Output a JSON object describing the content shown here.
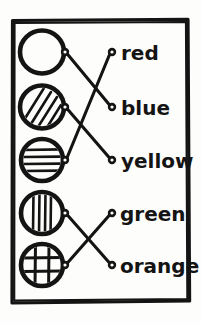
{
  "worksheet": {
    "style": "hand-drawn",
    "ink_color": "#141414",
    "paper_color": "#fdfdfb",
    "frame": {
      "x": 11,
      "y": 19,
      "width": 179,
      "height": 285
    }
  },
  "left_column": {
    "label": "patterned-circles",
    "items": [
      {
        "id": "circle-empty",
        "pattern": "empty",
        "pattern_label": "blank circle",
        "cx": 42,
        "cy": 52,
        "r": 22,
        "dot_x": 65,
        "dot_y": 52
      },
      {
        "id": "circle-diagonal",
        "pattern": "diagonal-stripes",
        "pattern_label": "diagonal stripes circle",
        "cx": 42,
        "cy": 107,
        "r": 22,
        "dot_x": 65,
        "dot_y": 107
      },
      {
        "id": "circle-horizontal",
        "pattern": "horizontal-stripes",
        "pattern_label": "horizontal stripes circle",
        "cx": 42,
        "cy": 160,
        "r": 21,
        "dot_x": 65,
        "dot_y": 160
      },
      {
        "id": "circle-vertical",
        "pattern": "vertical-stripes",
        "pattern_label": "vertical stripes circle",
        "cx": 42,
        "cy": 213,
        "r": 21,
        "dot_x": 65,
        "dot_y": 213
      },
      {
        "id": "circle-grid",
        "pattern": "grid-crosshatch",
        "pattern_label": "crosshatch grid circle",
        "cx": 42,
        "cy": 265,
        "r": 21,
        "dot_x": 65,
        "dot_y": 265
      }
    ]
  },
  "right_column": {
    "label": "color-words",
    "items": [
      {
        "id": "word-red",
        "text": "red",
        "dot_x": 112,
        "dot_y": 52,
        "text_x": 121,
        "text_y": 60
      },
      {
        "id": "word-blue",
        "text": "blue",
        "dot_x": 112,
        "dot_y": 107,
        "text_x": 121,
        "text_y": 115
      },
      {
        "id": "word-yellow",
        "text": "yellow",
        "dot_x": 112,
        "dot_y": 160,
        "text_x": 121,
        "text_y": 168
      },
      {
        "id": "word-green",
        "text": "green",
        "dot_x": 112,
        "dot_y": 213,
        "text_x": 120,
        "text_y": 221
      },
      {
        "id": "word-orange",
        "text": "orange",
        "dot_x": 112,
        "dot_y": 265,
        "text_x": 120,
        "text_y": 273
      }
    ]
  },
  "connections": [
    {
      "id": "link-empty-to-blue",
      "from": "circle-empty",
      "to": "word-blue",
      "x1": 65,
      "y1": 52,
      "x2": 112,
      "y2": 107
    },
    {
      "id": "link-diagonal-to-yellow",
      "from": "circle-diagonal",
      "to": "word-yellow",
      "x1": 65,
      "y1": 107,
      "x2": 112,
      "y2": 160
    },
    {
      "id": "link-horizontal-to-red",
      "from": "circle-horizontal",
      "to": "word-red",
      "x1": 65,
      "y1": 160,
      "x2": 112,
      "y2": 52
    },
    {
      "id": "link-vertical-to-orange",
      "from": "circle-vertical",
      "to": "word-orange",
      "x1": 65,
      "y1": 213,
      "x2": 112,
      "y2": 265
    },
    {
      "id": "link-grid-to-green",
      "from": "circle-grid",
      "to": "word-green",
      "x1": 65,
      "y1": 265,
      "x2": 112,
      "y2": 213
    }
  ]
}
